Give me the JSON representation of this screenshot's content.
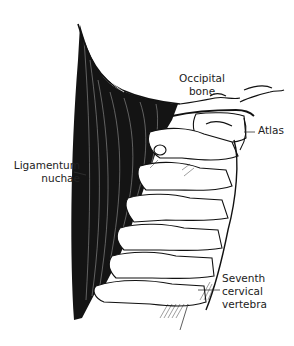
{
  "figure": {
    "colors": {
      "ink": "#111111",
      "background": "#ffffff",
      "label_text": "#222222"
    }
  },
  "labels": {
    "occipital_bone": [
      "Occipital",
      "bone"
    ],
    "atlas": [
      "Atlas"
    ],
    "ligamentum_nuchae": [
      "Ligamentum",
      "nuchae"
    ],
    "seventh_cervical_vertebra": [
      "Seventh",
      "cervical",
      "vertebra"
    ]
  }
}
